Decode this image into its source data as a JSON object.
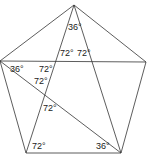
{
  "diagram": {
    "title": "",
    "stroke_color": "#333333",
    "vertices": {
      "top": [
        74,
        5
      ],
      "right": [
        146,
        62
      ],
      "bottom_right": [
        121,
        153
      ],
      "bottom_left": [
        26,
        153
      ],
      "left": [
        0,
        61
      ]
    },
    "edges": [
      [
        "top",
        "right"
      ],
      [
        "right",
        "bottom_right"
      ],
      [
        "bottom_right",
        "bottom_left"
      ],
      [
        "bottom_left",
        "left"
      ],
      [
        "left",
        "top"
      ],
      [
        "top",
        "bottom_left"
      ],
      [
        "top",
        "bottom_right"
      ],
      [
        "left",
        "right"
      ],
      [
        "left",
        "bottom_right"
      ]
    ],
    "labels": [
      {
        "text": "36°",
        "x": 68,
        "y": 30
      },
      {
        "text": "72°",
        "x": 60,
        "y": 56
      },
      {
        "text": "72°",
        "x": 77,
        "y": 56
      },
      {
        "text": "36°",
        "x": 10,
        "y": 72
      },
      {
        "text": "72°",
        "x": 39,
        "y": 72
      },
      {
        "text": "72°",
        "x": 34,
        "y": 84
      },
      {
        "text": "72°",
        "x": 43,
        "y": 111
      },
      {
        "text": "72°",
        "x": 32,
        "y": 149
      },
      {
        "text": "36°",
        "x": 96,
        "y": 149
      }
    ]
  }
}
